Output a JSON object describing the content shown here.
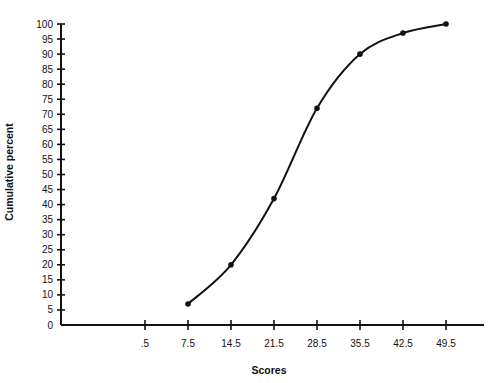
{
  "chart_data": {
    "type": "line",
    "title": "",
    "xlabel": "Scores",
    "ylabel": "Cumulative percent",
    "categories": [
      ".5",
      "7.5",
      "14.5",
      "21.5",
      "28.5",
      "35.5",
      "42.5",
      "49.5"
    ],
    "x": [
      0.5,
      7.5,
      14.5,
      21.5,
      28.5,
      35.5,
      42.5,
      49.5
    ],
    "series": [
      {
        "name": "Cumulative percent",
        "x": [
          7.5,
          14.5,
          21.5,
          28.5,
          35.5,
          42.5,
          49.5
        ],
        "values": [
          7,
          20,
          42,
          72,
          90,
          97,
          100
        ],
        "smooth": true,
        "markers": true
      }
    ],
    "yticks": [
      0,
      5,
      10,
      15,
      20,
      25,
      30,
      35,
      40,
      45,
      50,
      55,
      60,
      65,
      70,
      75,
      80,
      85,
      90,
      95,
      100
    ],
    "ylim": [
      0,
      100
    ],
    "grid": false,
    "legend": null
  },
  "layout": {
    "origin_x": 61,
    "origin_y": 325,
    "y_px_per_unit": 3.01,
    "x_first_tick_px": 145,
    "x_tick_spacing_px": 43,
    "x_axis_end_px": 484,
    "colors": {
      "line": "#111111",
      "axis": "#111111",
      "background": "#ffffff"
    }
  }
}
